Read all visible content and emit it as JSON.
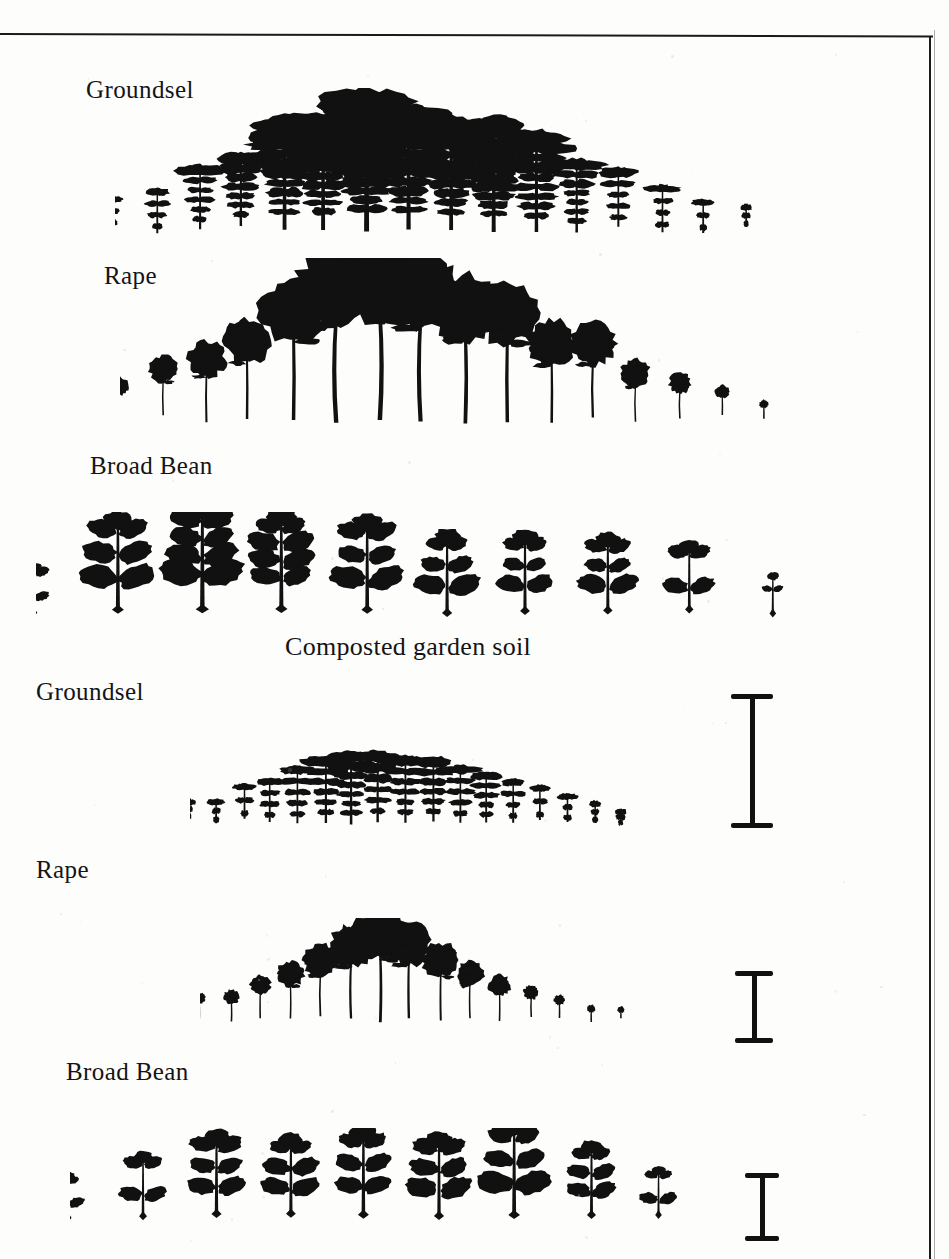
{
  "figure": {
    "caption_middle": "Composted garden soil",
    "background_color": "#fdfdfc",
    "ink_color": "#111111"
  },
  "panels": [
    {
      "id": "upper-panel",
      "soil": "",
      "rows": [
        {
          "species": "Groundsel",
          "label": "Groundsel",
          "count": 18,
          "shape": "rosette-lobed-spike",
          "heights": [
            26,
            38,
            54,
            62,
            96,
            98,
            120,
            104,
            96,
            98,
            86,
            62,
            50,
            40,
            28,
            18
          ],
          "peak_index": 6
        },
        {
          "species": "Rape",
          "label": "Rape",
          "count": 16,
          "shape": "round-canopy-on-stem",
          "heights": [
            30,
            44,
            60,
            74,
            104,
            128,
            132,
            124,
            110,
            104,
            76,
            70,
            46,
            34,
            22,
            14
          ],
          "peak_index": 6
        },
        {
          "species": "Broad Bean",
          "label": "Broad Bean",
          "count": 10,
          "shape": "opposite-oval-leaves",
          "heights": [
            34,
            68,
            76,
            70,
            66,
            58,
            56,
            54,
            48,
            28
          ],
          "peak_index": 2
        }
      ]
    },
    {
      "id": "lower-panel",
      "soil": "Composted garden soil",
      "rows": [
        {
          "species": "Groundsel",
          "label": "Groundsel",
          "count": 17,
          "shape": "rosette-lobed-spike",
          "heights": [
            16,
            20,
            30,
            38,
            50,
            58,
            64,
            62,
            58,
            56,
            50,
            44,
            38,
            30,
            24,
            18,
            12
          ],
          "peak_index": 6
        },
        {
          "species": "Rape",
          "label": "Rape",
          "count": 15,
          "shape": "round-canopy-on-stem",
          "heights": [
            18,
            22,
            30,
            40,
            50,
            64,
            78,
            66,
            54,
            40,
            32,
            22,
            16,
            12,
            8
          ],
          "peak_index": 6
        },
        {
          "species": "Broad Bean",
          "label": "Broad Bean",
          "count": 9,
          "shape": "opposite-oval-leaves",
          "heights": [
            28,
            40,
            52,
            50,
            56,
            52,
            60,
            46,
            30
          ],
          "peak_index": 6
        }
      ]
    }
  ],
  "scale_bars": [
    {
      "id": "scale-groundsel",
      "for_row": "Groundsel",
      "label": ""
    },
    {
      "id": "scale-rape",
      "for_row": "Rape",
      "label": ""
    },
    {
      "id": "scale-broad-bean",
      "for_row": "Broad Bean",
      "label": ""
    }
  ],
  "chart_data": {
    "type": "bar",
    "xlabel": "",
    "ylabel": "Plant height (silhouette)",
    "grid": false,
    "legend": "none",
    "annotations": [
      "Composted garden soil"
    ],
    "series": [
      {
        "name": "Groundsel (upper panel)",
        "values": [
          26,
          38,
          54,
          62,
          96,
          98,
          120,
          104,
          96,
          98,
          86,
          62,
          50,
          40,
          28,
          18
        ]
      },
      {
        "name": "Rape (upper panel)",
        "values": [
          30,
          44,
          60,
          74,
          104,
          128,
          132,
          124,
          110,
          104,
          76,
          70,
          46,
          34,
          22,
          14
        ]
      },
      {
        "name": "Broad Bean (upper panel)",
        "values": [
          34,
          68,
          76,
          70,
          66,
          58,
          56,
          54,
          48,
          28
        ]
      },
      {
        "name": "Groundsel (composted garden soil)",
        "values": [
          16,
          20,
          30,
          38,
          50,
          58,
          64,
          62,
          58,
          56,
          50,
          44,
          38,
          30,
          24,
          18,
          12
        ]
      },
      {
        "name": "Rape (composted garden soil)",
        "values": [
          18,
          22,
          30,
          40,
          50,
          64,
          78,
          66,
          54,
          40,
          32,
          22,
          16,
          12,
          8
        ]
      },
      {
        "name": "Broad Bean (composted garden soil)",
        "values": [
          28,
          40,
          52,
          50,
          56,
          52,
          60,
          46,
          30
        ]
      }
    ]
  }
}
